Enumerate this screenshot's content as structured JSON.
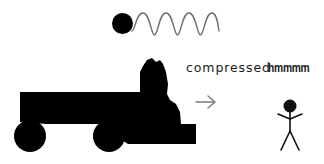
{
  "scene": {
    "title": "compressed spring truck cartoon",
    "background_color": "#ffffff",
    "ink_color": "#000000",
    "stroke_color": "#6b6b6b",
    "width": 324,
    "height": 164
  },
  "annotations": {
    "compressed_label": "compressed",
    "hmmmm_label": "hmmmm"
  },
  "objects": {
    "ball_label": "black ball",
    "spring_label": "coiled spring wave",
    "truck_label": "crushed flatbed truck silhouette",
    "arrow_label": "rightward motion arrow",
    "person_label": "stick figure person"
  },
  "spring": {
    "cycles": 4,
    "amplitude": 11,
    "start_x": 132,
    "end_x": 218,
    "center_y": 24
  },
  "truck": {
    "bed_x": 20,
    "bed_y": 92,
    "bed_width": 120,
    "bed_height": 30,
    "wheel_radius": 16,
    "wheel_one_cx": 30,
    "wheel_two_cx": 109,
    "wheel_cy": 136
  }
}
